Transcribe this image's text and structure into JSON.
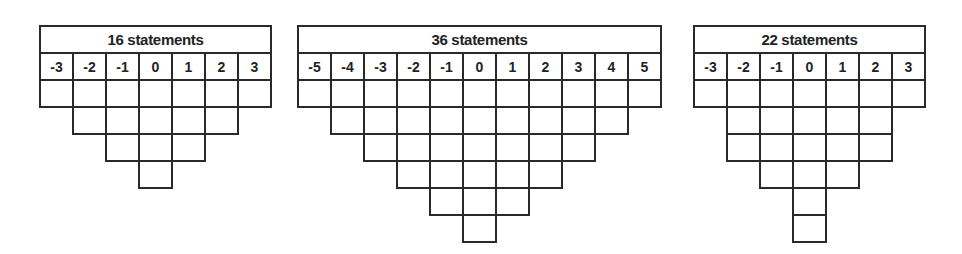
{
  "grids": [
    {
      "title": "16 statements",
      "left": 39,
      "column_labels": [
        "-3",
        "-2",
        "-1",
        "0",
        "1",
        "2",
        "3"
      ],
      "column_heights": [
        1,
        2,
        3,
        4,
        3,
        2,
        1
      ]
    },
    {
      "title": "36 statements",
      "left": 297,
      "column_labels": [
        "-5",
        "-4",
        "-3",
        "-2",
        "-1",
        "0",
        "1",
        "2",
        "3",
        "4",
        "5"
      ],
      "column_heights": [
        1,
        2,
        3,
        4,
        5,
        6,
        5,
        4,
        3,
        2,
        1
      ]
    },
    {
      "title": "22 statements",
      "left": 693,
      "column_labels": [
        "-3",
        "-2",
        "-1",
        "0",
        "1",
        "2",
        "3"
      ],
      "column_heights": [
        1,
        3,
        4,
        6,
        4,
        3,
        1
      ]
    }
  ]
}
